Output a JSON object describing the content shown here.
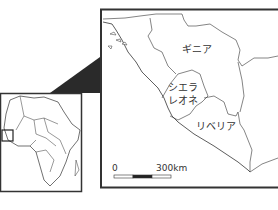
{
  "map": {
    "labels": {
      "guinea": "ギニア",
      "sierra_leone_1": "シエラ",
      "sierra_leone_2": "レオネ",
      "liberia": "リベリア"
    },
    "scale_bar": {
      "start": "0",
      "end": "300km"
    }
  },
  "colors": {
    "border": "#333333",
    "fill": "#ffffff",
    "connector": "#2a2a2a"
  }
}
